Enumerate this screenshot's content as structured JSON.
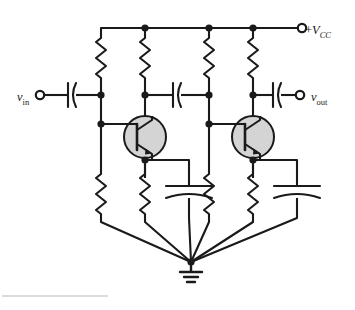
{
  "figure": {
    "background_color": "#ffffff",
    "line_color": "#1a1a1a",
    "transistor_fill": "#d4d4d4",
    "footer_rule_color": "#b8b8b8"
  },
  "labels": {
    "input": {
      "symbol": "v",
      "subscript": "in",
      "full": "vin"
    },
    "output": {
      "symbol": "v",
      "subscript": "out",
      "full": "vout"
    },
    "supply": {
      "prefix": "+",
      "symbol": "V",
      "subscript": "CC",
      "full": "+VCC"
    }
  },
  "terminals": [
    {
      "name": "input-terminal",
      "label": "vin",
      "x": 38,
      "y": 95
    },
    {
      "name": "output-terminal",
      "label": "vout",
      "x": 300,
      "y": 95
    },
    {
      "name": "supply-terminal",
      "label": "+VCC",
      "x": 300,
      "y": 28
    }
  ],
  "nets": {
    "supply_rail_y": 28,
    "coupling_row_y": 95,
    "base_row_y": 124,
    "emitter_row_y": 160,
    "ground_node": {
      "x": 191,
      "y": 262
    }
  },
  "rails": [
    {
      "name": "rail-rb1-stage1",
      "x": 101
    },
    {
      "name": "rail-rc1-stage1",
      "x": 145
    },
    {
      "name": "rail-rb2-stage2",
      "x": 209
    },
    {
      "name": "rail-rc2-stage2",
      "x": 253
    }
  ],
  "components": {
    "resistors": [
      {
        "name": "resistor-rb1-upper",
        "rail": "rail-rb1-stage1",
        "position": "upper",
        "x": 101,
        "y1": 34,
        "y2": 82
      },
      {
        "name": "resistor-rc1",
        "rail": "rail-rc1-stage1",
        "position": "upper",
        "x": 145,
        "y1": 34,
        "y2": 82
      },
      {
        "name": "resistor-rb2-upper",
        "rail": "rail-rb2-stage2",
        "position": "upper",
        "x": 209,
        "y1": 34,
        "y2": 82
      },
      {
        "name": "resistor-rc2",
        "rail": "rail-rc2-stage2",
        "position": "upper",
        "x": 253,
        "y1": 34,
        "y2": 82
      },
      {
        "name": "resistor-rb1-lower",
        "rail": "rail-rb1-stage1",
        "position": "lower",
        "x": 101,
        "y1": 178,
        "y2": 218
      },
      {
        "name": "resistor-re1",
        "rail": "rail-rc1-stage1",
        "position": "lower",
        "x": 145,
        "y1": 178,
        "y2": 218
      },
      {
        "name": "resistor-rb2-lower",
        "rail": "rail-rb2-stage2",
        "position": "lower",
        "x": 209,
        "y1": 178,
        "y2": 218
      },
      {
        "name": "resistor-re2",
        "rail": "rail-rc2-stage2",
        "position": "lower",
        "x": 253,
        "y1": 178,
        "y2": 218
      }
    ],
    "capacitors": [
      {
        "name": "capacitor-input-coupling",
        "orientation": "vertical-plates",
        "x": 72,
        "y": 95
      },
      {
        "name": "capacitor-interstage",
        "orientation": "vertical-plates",
        "x": 177,
        "y": 95
      },
      {
        "name": "capacitor-output-coupling",
        "orientation": "vertical-plates",
        "x": 277,
        "y": 95
      },
      {
        "name": "capacitor-emitter-bypass-1",
        "orientation": "horizontal-plates",
        "x": 177,
        "y": 192
      },
      {
        "name": "capacitor-emitter-bypass-2",
        "orientation": "horizontal-plates",
        "x": 285,
        "y": 192
      }
    ],
    "transistors": [
      {
        "name": "transistor-q1",
        "type": "npn",
        "cx": 145,
        "cy": 137,
        "r": 21
      },
      {
        "name": "transistor-q2",
        "type": "npn",
        "cx": 253,
        "cy": 137,
        "r": 21
      }
    ],
    "ground": {
      "name": "ground-symbol",
      "x": 191,
      "y": 262
    }
  },
  "junction_dots": [
    {
      "name": "junction-supply-rc1",
      "x": 145,
      "y": 28
    },
    {
      "name": "junction-supply-rb2",
      "x": 209,
      "y": 28
    },
    {
      "name": "junction-supply-rc2",
      "x": 253,
      "y": 28
    },
    {
      "name": "junction-base1-coupling",
      "x": 101,
      "y": 95
    },
    {
      "name": "junction-collector1",
      "x": 145,
      "y": 95
    },
    {
      "name": "junction-base2-node",
      "x": 209,
      "y": 95
    },
    {
      "name": "junction-collector2",
      "x": 253,
      "y": 95
    },
    {
      "name": "junction-base1",
      "x": 101,
      "y": 124
    },
    {
      "name": "junction-base2",
      "x": 209,
      "y": 124
    },
    {
      "name": "junction-emitter1",
      "x": 145,
      "y": 160
    },
    {
      "name": "junction-emitter2",
      "x": 253,
      "y": 160
    }
  ]
}
